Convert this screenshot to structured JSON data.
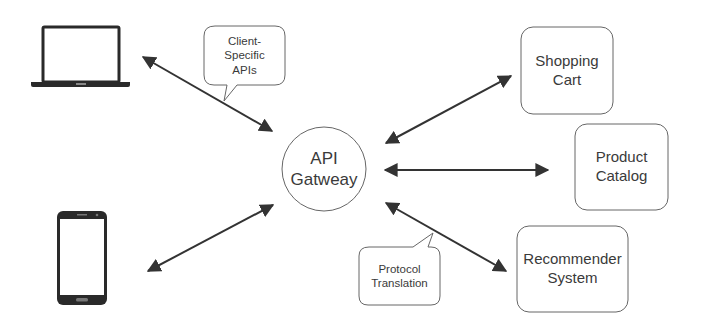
{
  "diagram": {
    "clients": [
      {
        "id": "laptop",
        "icon": "laptop-icon"
      },
      {
        "id": "phone",
        "icon": "smartphone-icon"
      }
    ],
    "gateway": {
      "label": "API\nGatweay"
    },
    "services": [
      {
        "id": "shopping-cart",
        "label": "Shopping\nCart"
      },
      {
        "id": "product-catalog",
        "label": "Product\nCatalog"
      },
      {
        "id": "recommender-system",
        "label": "Recommender\nSystem"
      }
    ],
    "callouts": [
      {
        "id": "client-specific-apis",
        "label": "Client-\nSpecific\nAPIs"
      },
      {
        "id": "protocol-translation",
        "label": "Protocol\nTranslation"
      }
    ],
    "connections": [
      {
        "from": "laptop",
        "to": "gateway",
        "type": "bidirectional"
      },
      {
        "from": "phone",
        "to": "gateway",
        "type": "bidirectional"
      },
      {
        "from": "gateway",
        "to": "shopping-cart",
        "type": "bidirectional"
      },
      {
        "from": "gateway",
        "to": "product-catalog",
        "type": "bidirectional"
      },
      {
        "from": "gateway",
        "to": "recommender-system",
        "type": "bidirectional"
      }
    ],
    "colors": {
      "stroke": "#333333",
      "box_border": "#555555",
      "text": "#3a3a3a",
      "background": "#ffffff"
    }
  }
}
